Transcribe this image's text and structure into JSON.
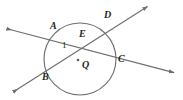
{
  "figure": {
    "kind": "circle-with-two-secants",
    "stroke_color": "#6d6e71",
    "label_color": "#231f20",
    "background": "#ffffff",
    "circle": {
      "cx": 80,
      "cy": 59,
      "r": 36
    },
    "center_dot": {
      "cx": 78,
      "cy": 60,
      "r": 1.3
    },
    "intersection": {
      "x": 77.5,
      "y": 45
    },
    "secants": [
      {
        "name": "secant-A-C",
        "from": {
          "x": 5,
          "y": 28
        },
        "to": {
          "x": 176,
          "y": 73
        },
        "chord_endpoints": [
          "A",
          "C"
        ]
      },
      {
        "name": "secant-B-D",
        "from": {
          "x": 12,
          "y": 93
        },
        "to": {
          "x": 149,
          "y": 5
        },
        "chord_endpoints": [
          "B",
          "D"
        ]
      }
    ],
    "labels": [
      {
        "id": "A",
        "text": "A",
        "x": 50,
        "y": 26,
        "kind": "point"
      },
      {
        "id": "D",
        "text": "D",
        "x": 104,
        "y": 15,
        "kind": "point"
      },
      {
        "id": "E",
        "text": "E",
        "x": 79,
        "y": 34,
        "kind": "point"
      },
      {
        "id": "one",
        "text": "1",
        "x": 62,
        "y": 45,
        "kind": "angle"
      },
      {
        "id": "Q",
        "text": "Q",
        "x": 82,
        "y": 64,
        "kind": "center"
      },
      {
        "id": "C",
        "text": "C",
        "x": 118,
        "y": 58,
        "kind": "point"
      },
      {
        "id": "B",
        "text": "B",
        "x": 42,
        "y": 76,
        "kind": "point"
      }
    ]
  }
}
